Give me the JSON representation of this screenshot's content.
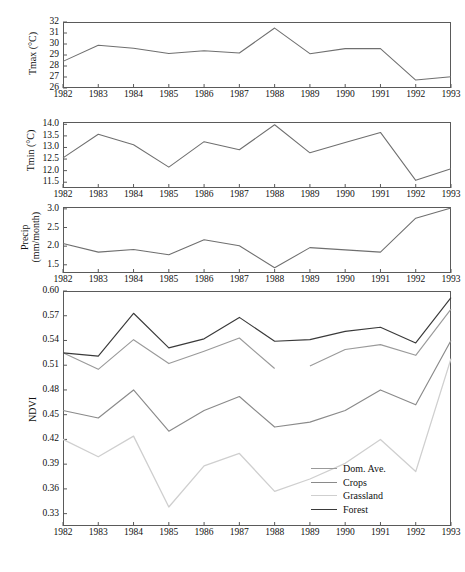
{
  "figure": {
    "x_years": [
      1982,
      1983,
      1984,
      1985,
      1986,
      1987,
      1988,
      1989,
      1990,
      1991,
      1992,
      1993
    ],
    "colors": {
      "frame": "#5a5a5a",
      "dom_ave": "#9a9a9a",
      "crops": "#8a8a8a",
      "grassland": "#cfcfcf",
      "forest": "#3a3a3a",
      "weather_line": "#6f6f6f"
    }
  },
  "chart_data": [
    {
      "type": "line",
      "title": "",
      "ylabel": "Tmax (°C)",
      "xlabel": "",
      "ylim": [
        26,
        32
      ],
      "yticks": [
        26,
        27,
        28,
        29,
        30,
        31,
        32
      ],
      "ytick_labels": [
        "26",
        "27",
        "28",
        "29",
        "30",
        "31",
        "32"
      ],
      "x": [
        1982,
        1983,
        1984,
        1985,
        1986,
        1987,
        1988,
        1989,
        1990,
        1991,
        1992,
        1993
      ],
      "xtick_labels": [
        "1982",
        "1983",
        "1984",
        "1985",
        "1986",
        "1987",
        "1988",
        "1989",
        "1990",
        "1991",
        "1992",
        "1993"
      ],
      "grid": false,
      "series": [
        {
          "name": "Tmax",
          "values": [
            28.42,
            29.88,
            29.62,
            29.14,
            29.38,
            29.18,
            31.45,
            29.12,
            29.58,
            29.58,
            26.72,
            27.02
          ]
        }
      ]
    },
    {
      "type": "line",
      "title": "",
      "ylabel": "Tmin (°C)",
      "xlabel": "",
      "ylim": [
        11.25,
        14.1
      ],
      "yticks": [
        11.5,
        12.0,
        12.5,
        13.0,
        13.5,
        14.0
      ],
      "ytick_labels": [
        "11.5",
        "12.0",
        "12.5",
        "13.0",
        "13.5",
        "14.0"
      ],
      "x": [
        1982,
        1983,
        1984,
        1985,
        1986,
        1987,
        1988,
        1989,
        1990,
        1991,
        1992,
        1993
      ],
      "xtick_labels": [
        "1982",
        "1983",
        "1984",
        "1985",
        "1986",
        "1987",
        "1988",
        "1989",
        "1990",
        "1991",
        "1992",
        "1993"
      ],
      "grid": false,
      "series": [
        {
          "name": "Tmin",
          "values": [
            12.55,
            13.57,
            13.12,
            12.15,
            13.25,
            12.9,
            13.98,
            12.77,
            13.22,
            13.65,
            11.58,
            12.08
          ]
        }
      ]
    },
    {
      "type": "line",
      "title": "",
      "ylabel": "Precip (mm/month)",
      "xlabel": "",
      "ylim": [
        1.28,
        3.05
      ],
      "yticks": [
        1.5,
        2.0,
        2.5,
        3.0
      ],
      "ytick_labels": [
        "1.5",
        "2.0",
        "2.5",
        "3.0"
      ],
      "x": [
        1982,
        1983,
        1984,
        1985,
        1986,
        1987,
        1988,
        1989,
        1990,
        1991,
        1992,
        1993
      ],
      "xtick_labels": [
        "1982",
        "1983",
        "1984",
        "1985",
        "1986",
        "1987",
        "1988",
        "1989",
        "1990",
        "1991",
        "1992",
        "1993"
      ],
      "grid": false,
      "series": [
        {
          "name": "Precip",
          "values": [
            2.07,
            1.84,
            1.91,
            1.77,
            2.17,
            2.01,
            1.42,
            1.96,
            1.9,
            1.84,
            2.75,
            3.02
          ]
        }
      ]
    },
    {
      "type": "line",
      "title": "",
      "ylabel": "NDVI",
      "xlabel": "",
      "ylim": [
        0.315,
        0.6
      ],
      "yticks": [
        0.33,
        0.36,
        0.39,
        0.42,
        0.45,
        0.48,
        0.51,
        0.54,
        0.57,
        0.6
      ],
      "ytick_labels": [
        "0.33",
        "0.36",
        "0.39",
        "0.42",
        "0.45",
        "0.48",
        "0.51",
        "0.54",
        "0.57",
        "0.60"
      ],
      "x": [
        1982,
        1983,
        1984,
        1985,
        1986,
        1987,
        1988,
        1989,
        1990,
        1991,
        1992,
        1993
      ],
      "xtick_labels": [
        "1982",
        "1983",
        "1984",
        "1985",
        "1986",
        "1987",
        "1988",
        "1989",
        "1990",
        "1991",
        "1992",
        "1993"
      ],
      "grid": false,
      "legend_position": "bottom-right",
      "series": [
        {
          "name": "Dom. Ave.",
          "values": [
            0.525,
            0.505,
            0.541,
            0.512,
            0.527,
            0.543,
            0.506,
            0.509,
            0.529,
            0.535,
            0.522,
            0.578
          ]
        },
        {
          "name": "Crops",
          "values": [
            0.526,
            0.522,
            0.541,
            0.512,
            0.527,
            0.543,
            0.506,
            0.509,
            0.529,
            0.535,
            0.522,
            0.578
          ]
        },
        {
          "name": "Grassland",
          "values": [
            0.42,
            0.399,
            0.424,
            0.338,
            0.388,
            0.403,
            0.357,
            0.372,
            0.391,
            0.42,
            0.381,
            0.518
          ]
        },
        {
          "name": "Forest",
          "values": [
            0.525,
            0.521,
            0.573,
            0.531,
            0.542,
            0.568,
            0.539,
            0.541,
            0.551,
            0.556,
            0.537,
            0.592
          ]
        },
        {
          "name": "Crops-mid",
          "values": [
            0.455,
            0.446,
            0.48,
            0.43,
            0.455,
            0.472,
            0.435,
            0.441,
            0.455,
            0.48,
            0.462,
            0.54
          ]
        }
      ]
    }
  ],
  "legend": {
    "items": [
      {
        "label": "Dom. Ave.",
        "color": "#9a9a9a"
      },
      {
        "label": "Crops",
        "color": "#8a8a8a"
      },
      {
        "label": "Grassland",
        "color": "#cfcfcf"
      },
      {
        "label": "Forest",
        "color": "#3a3a3a"
      }
    ]
  }
}
